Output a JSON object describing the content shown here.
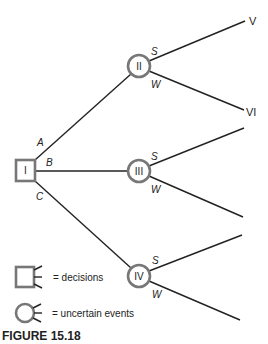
{
  "figure": {
    "caption": "FIGURE 15.18",
    "type": "decision-tree",
    "colors": {
      "line": "#222222",
      "node_border": "#777777"
    }
  },
  "nodes": {
    "I": {
      "label": "I",
      "kind": "decision"
    },
    "II": {
      "label": "II",
      "kind": "uncertain"
    },
    "III": {
      "label": "III",
      "kind": "uncertain"
    },
    "IV": {
      "label": "IV",
      "kind": "uncertain"
    }
  },
  "branches": {
    "decision": [
      "A",
      "B",
      "C"
    ],
    "event_success": "S",
    "event_weak": "W"
  },
  "leaves": {
    "II_S": "V",
    "II_W": "VI"
  },
  "legend": {
    "decisions": "= decisions",
    "uncertain": "= uncertain events"
  }
}
